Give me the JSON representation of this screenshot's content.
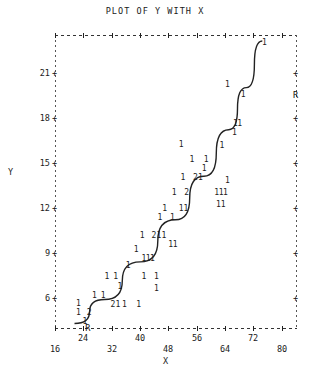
{
  "chart_data": {
    "type": "scatter",
    "title": "PLOT OF Y WITH X",
    "xlabel": "X",
    "ylabel": "Y",
    "xlim": [
      16,
      84
    ],
    "ylim": [
      4,
      23.5
    ],
    "grid": false,
    "legend": "none",
    "marker_symbol": "1",
    "overlap_symbol": "2",
    "regression_symbol": "R",
    "xticks": [
      16,
      24,
      32,
      40,
      48,
      56,
      64,
      72,
      80
    ],
    "xticklabels": [
      "16",
      "24",
      "32",
      "40",
      "48",
      "56",
      "64",
      "72",
      "80"
    ],
    "yticks": [
      6,
      9,
      12,
      15,
      18,
      21
    ],
    "yticklabels": [
      "6",
      "9",
      "12",
      "15",
      "18",
      "21"
    ],
    "points": [
      {
        "x": 22.5,
        "y": 5.6,
        "n": 1
      },
      {
        "x": 22.5,
        "y": 5.0,
        "n": 1
      },
      {
        "x": 24.3,
        "y": 4.4,
        "n": 1
      },
      {
        "x": 25.5,
        "y": 5.0,
        "n": 2
      },
      {
        "x": 27.0,
        "y": 6.1,
        "n": 1
      },
      {
        "x": 29.5,
        "y": 6.1,
        "n": 1
      },
      {
        "x": 32.2,
        "y": 5.5,
        "n": 2
      },
      {
        "x": 33.6,
        "y": 5.5,
        "n": 1
      },
      {
        "x": 35.5,
        "y": 5.5,
        "n": 1
      },
      {
        "x": 34.2,
        "y": 6.7,
        "n": 1
      },
      {
        "x": 39.5,
        "y": 5.5,
        "n": 1
      },
      {
        "x": 30.5,
        "y": 7.4,
        "n": 1
      },
      {
        "x": 33.0,
        "y": 7.4,
        "n": 1
      },
      {
        "x": 36.5,
        "y": 8.1,
        "n": 1
      },
      {
        "x": 41.0,
        "y": 7.4,
        "n": 1
      },
      {
        "x": 44.5,
        "y": 7.4,
        "n": 1
      },
      {
        "x": 44.5,
        "y": 6.6,
        "n": 1
      },
      {
        "x": 38.8,
        "y": 9.2,
        "n": 1
      },
      {
        "x": 41.0,
        "y": 8.6,
        "n": 1
      },
      {
        "x": 42.2,
        "y": 8.6,
        "n": 1
      },
      {
        "x": 43.4,
        "y": 8.6,
        "n": 1
      },
      {
        "x": 40.5,
        "y": 10.1,
        "n": 1
      },
      {
        "x": 43.8,
        "y": 10.1,
        "n": 2
      },
      {
        "x": 45.2,
        "y": 10.1,
        "n": 1
      },
      {
        "x": 46.6,
        "y": 10.1,
        "n": 1
      },
      {
        "x": 48.5,
        "y": 9.5,
        "n": 1
      },
      {
        "x": 49.8,
        "y": 9.5,
        "n": 1
      },
      {
        "x": 45.5,
        "y": 11.3,
        "n": 1
      },
      {
        "x": 46.8,
        "y": 11.9,
        "n": 1
      },
      {
        "x": 49.0,
        "y": 11.3,
        "n": 1
      },
      {
        "x": 51.5,
        "y": 11.9,
        "n": 1
      },
      {
        "x": 52.8,
        "y": 11.9,
        "n": 1
      },
      {
        "x": 49.5,
        "y": 13.0,
        "n": 1
      },
      {
        "x": 53.0,
        "y": 13.0,
        "n": 2
      },
      {
        "x": 52.0,
        "y": 14.0,
        "n": 1
      },
      {
        "x": 55.5,
        "y": 14.0,
        "n": 2
      },
      {
        "x": 56.9,
        "y": 14.0,
        "n": 1
      },
      {
        "x": 58.0,
        "y": 14.6,
        "n": 1
      },
      {
        "x": 54.5,
        "y": 15.2,
        "n": 1
      },
      {
        "x": 58.5,
        "y": 15.2,
        "n": 1
      },
      {
        "x": 51.5,
        "y": 16.2,
        "n": 1
      },
      {
        "x": 61.5,
        "y": 13.0,
        "n": 1
      },
      {
        "x": 62.8,
        "y": 13.0,
        "n": 1
      },
      {
        "x": 64.0,
        "y": 13.0,
        "n": 1
      },
      {
        "x": 62.0,
        "y": 12.2,
        "n": 1
      },
      {
        "x": 63.3,
        "y": 12.2,
        "n": 1
      },
      {
        "x": 64.5,
        "y": 13.8,
        "n": 1
      },
      {
        "x": 63.0,
        "y": 16.1,
        "n": 1
      },
      {
        "x": 66.5,
        "y": 17.0,
        "n": 1
      },
      {
        "x": 68.0,
        "y": 17.6,
        "n": 1
      },
      {
        "x": 66.8,
        "y": 17.6,
        "n": 1
      },
      {
        "x": 69.0,
        "y": 19.5,
        "n": 1
      },
      {
        "x": 64.5,
        "y": 20.2,
        "n": 1
      },
      {
        "x": 75.0,
        "y": 23.0,
        "n": 1
      }
    ],
    "fit_line": {
      "description": "smooth increasing fitted curve through the cloud",
      "path": [
        {
          "x": 21.5,
          "y": 4.3
        },
        {
          "x": 30.0,
          "y": 5.9
        },
        {
          "x": 40.0,
          "y": 8.4
        },
        {
          "x": 50.0,
          "y": 11.2
        },
        {
          "x": 58.0,
          "y": 14.1
        },
        {
          "x": 65.0,
          "y": 17.2
        },
        {
          "x": 70.0,
          "y": 20.0
        },
        {
          "x": 74.5,
          "y": 23.1
        }
      ]
    }
  }
}
